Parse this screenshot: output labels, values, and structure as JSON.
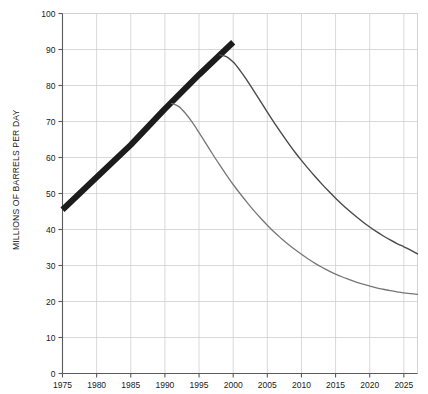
{
  "chart_data": {
    "type": "line",
    "title": "",
    "xlabel": "",
    "ylabel": "MILLIONS OF BARRELS PER DAY",
    "xlim": [
      1975,
      2027
    ],
    "ylim": [
      0,
      100
    ],
    "grid": true,
    "legend": "none",
    "xticks": [
      1975,
      1980,
      1985,
      1990,
      1995,
      2000,
      2005,
      2010,
      2015,
      2020,
      2025
    ],
    "xtick_labels": [
      "1975",
      "1980",
      "1985",
      "1990",
      "1995",
      "2000",
      "2005",
      "2010",
      "2015",
      "2020",
      "2025"
    ],
    "yticks": [
      0,
      10,
      20,
      30,
      40,
      50,
      60,
      70,
      80,
      90,
      100
    ],
    "ytick_labels": [
      "0",
      "10",
      "20",
      "30",
      "40",
      "50",
      "60",
      "70",
      "80",
      "90",
      "100"
    ],
    "series": [
      {
        "name": "historical-and-projected-production",
        "style": "thick-black-line",
        "color": "#1c1c1c",
        "linewidth": 6,
        "x": [
          1975,
          1980,
          1985,
          1990,
          1995,
          2000
        ],
        "values": [
          45.5,
          54.5,
          63.5,
          73.5,
          83.0,
          92.0
        ]
      },
      {
        "name": "upper-decline-curve",
        "style": "thin-dark-curve",
        "color": "#4a4a4a",
        "linewidth": 1.4,
        "x": [
          1998,
          1999,
          2000,
          2001,
          2002,
          2003,
          2004,
          2005,
          2006,
          2007,
          2008,
          2009,
          2010,
          2011,
          2012,
          2013,
          2014,
          2015,
          2016,
          2017,
          2018,
          2019,
          2020,
          2021,
          2022,
          2023,
          2024,
          2025,
          2026,
          2027
        ],
        "values": [
          88.5,
          88.0,
          86.5,
          84.2,
          81.5,
          78.6,
          75.6,
          72.6,
          69.7,
          66.9,
          64.2,
          61.6,
          59.2,
          56.9,
          54.7,
          52.6,
          50.6,
          48.7,
          46.9,
          45.2,
          43.6,
          42.1,
          40.7,
          39.4,
          38.2,
          37.1,
          36.1,
          35.2,
          34.3,
          33.2
        ]
      },
      {
        "name": "lower-decline-curve",
        "style": "thin-gray-curve",
        "color": "#777777",
        "linewidth": 1.3,
        "x": [
          1991,
          1992,
          1993,
          1994,
          1995,
          1996,
          1997,
          1998,
          1999,
          2000,
          2001,
          2002,
          2003,
          2004,
          2005,
          2006,
          2007,
          2008,
          2009,
          2010,
          2011,
          2012,
          2013,
          2014,
          2015,
          2016,
          2017,
          2018,
          2019,
          2020,
          2021,
          2022,
          2023,
          2024,
          2025,
          2026,
          2027
        ],
        "values": [
          75.0,
          74.2,
          72.3,
          69.8,
          66.9,
          63.9,
          60.9,
          58.0,
          55.2,
          52.5,
          50.0,
          47.6,
          45.3,
          43.2,
          41.2,
          39.3,
          37.6,
          36.0,
          34.5,
          33.1,
          31.8,
          30.6,
          29.5,
          28.5,
          27.6,
          26.8,
          26.1,
          25.4,
          24.8,
          24.3,
          23.8,
          23.4,
          23.0,
          22.7,
          22.4,
          22.2,
          22.0
        ]
      }
    ]
  },
  "colors": {
    "grid": "#cfcfcf",
    "axis": "#5a5a5a",
    "text": "#1a1a1a",
    "background": "#ffffff"
  }
}
